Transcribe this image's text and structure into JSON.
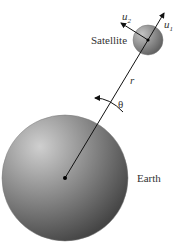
{
  "labels": {
    "satellite": "Satellite",
    "earth": "Earth",
    "r": "r",
    "theta": "θ",
    "u1_base": "u",
    "u1_sub": "1",
    "u2_base": "u",
    "u2_sub": "2"
  },
  "colors": {
    "earth_light": "#c8c8c8",
    "earth_dark": "#4a4a4a",
    "satellite_light": "#bdbdbd",
    "satellite_dark": "#555555",
    "line": "#111111"
  }
}
